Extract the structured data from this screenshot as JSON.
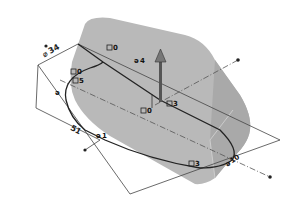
{
  "viewport": {
    "title": "3D sketch view",
    "colors": {
      "background": "#ffffff",
      "body_fill": "#b9b9b9",
      "body_shade": "#a8a8a8",
      "edge": "#333333",
      "sketch_line": "#444444",
      "centerline": "#555555",
      "arrow": "#555555"
    }
  },
  "relations": [
    {
      "id": "rel-0-top",
      "icon": "coincident-icon",
      "text": "0"
    },
    {
      "id": "rel-4",
      "icon": "tangent-icon",
      "text": "4"
    },
    {
      "id": "rel-0-left",
      "icon": "coincident-icon",
      "text": "0"
    },
    {
      "id": "rel-5",
      "icon": "coincident-icon",
      "text": "5"
    },
    {
      "id": "rel-0-center",
      "icon": "coincident-icon",
      "text": "0"
    },
    {
      "id": "rel-3-center",
      "icon": "coincident-icon",
      "text": "3"
    },
    {
      "id": "rel-3-bottom",
      "icon": "coincident-icon",
      "text": "3"
    },
    {
      "id": "rel-1",
      "icon": "tangent-icon",
      "text": "1"
    },
    {
      "id": "rel-10",
      "icon": "tangent-icon",
      "text": "10"
    }
  ],
  "dimensions": [
    {
      "id": "dim-top-left",
      "text": "34",
      "symbol": "⌀"
    },
    {
      "id": "dim-left-bottom",
      "text": "51"
    }
  ],
  "direction_arrow": {
    "label": "extrude-direction"
  }
}
